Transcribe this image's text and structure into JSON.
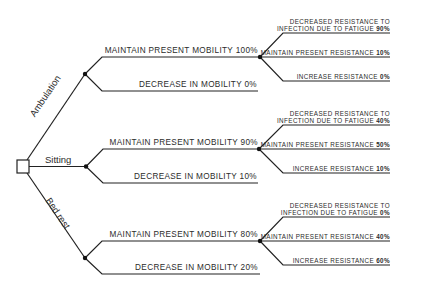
{
  "diagram": {
    "type": "decision-tree",
    "root": {
      "shape": "square"
    },
    "choices": [
      {
        "label": "Ambulation",
        "outcomes": [
          {
            "label": "MAINTAIN PRESENT MOBILITY 100%",
            "sub_outcomes": [
              {
                "line1": "DECREASED RESISTANCE TO",
                "line2": "INFECTION DUE TO FATIGUE",
                "pct": "90%"
              },
              {
                "line1": "MAINTAIN PRESENT RESISTANCE",
                "pct": "10%"
              },
              {
                "line1": "INCREASE RESISTANCE",
                "pct": "0%"
              }
            ]
          },
          {
            "label": "DECREASE IN MOBILITY 0%"
          }
        ]
      },
      {
        "label": "Sitting",
        "outcomes": [
          {
            "label": "MAINTAIN PRESENT MOBILITY 90%",
            "sub_outcomes": [
              {
                "line1": "DECREASED RESISTANCE TO",
                "line2": "INFECTION DUE TO FATIGUE",
                "pct": "40%"
              },
              {
                "line1": "MAINTAIN PRESENT RESISTANCE",
                "pct": "50%"
              },
              {
                "line1": "INCREASE RESISTANCE",
                "pct": "10%"
              }
            ]
          },
          {
            "label": "DECREASE IN MOBILITY 10%"
          }
        ]
      },
      {
        "label": "Bed rest",
        "outcomes": [
          {
            "label": "MAINTAIN PRESENT MOBILITY 80%",
            "sub_outcomes": [
              {
                "line1": "DECREASED RESISTANCE TO",
                "line2": "INFECTION DUE TO FATIGUE",
                "pct": "0%"
              },
              {
                "line1": "MAINTAIN PRESENT RESISTANCE",
                "pct": "40%"
              },
              {
                "line1": "INCREASE RESISTANCE",
                "pct": "60%"
              }
            ]
          },
          {
            "label": "DECREASE IN MOBILITY 20%"
          }
        ]
      }
    ],
    "colors": {
      "line": "#222222",
      "text": "#2b2b2b",
      "background": "#ffffff"
    }
  }
}
